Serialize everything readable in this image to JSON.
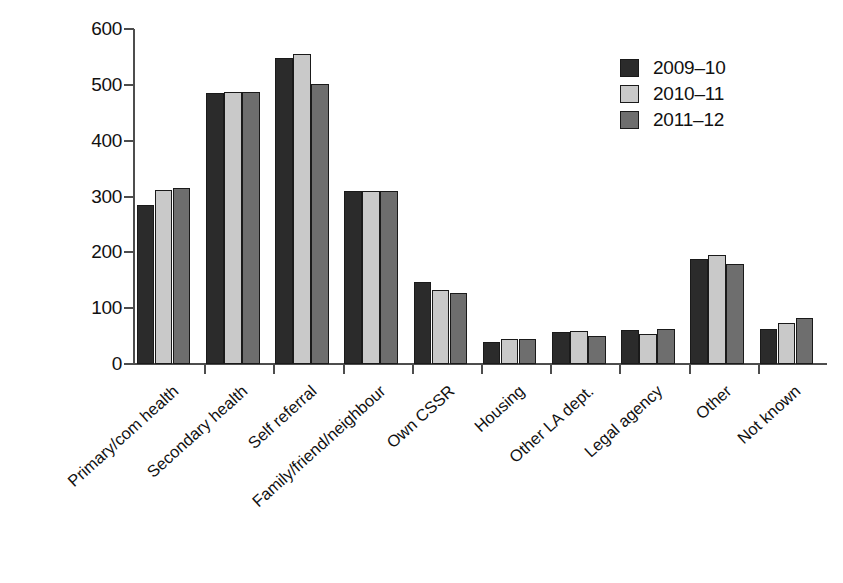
{
  "chart_data": {
    "type": "bar",
    "title": "",
    "subtitle": "",
    "xlabel": "",
    "ylabel": "",
    "ylim": [
      0,
      600
    ],
    "ytick_labels": [
      "600",
      "500",
      "400",
      "300",
      "200",
      "100",
      "0"
    ],
    "yticks": [
      600,
      500,
      400,
      300,
      200,
      100,
      0
    ],
    "grid": false,
    "legend_position": "top-right",
    "categories": [
      "Primary/com health",
      "Secondary health",
      "Self referral",
      "Family/friend/neighbour",
      "Own CSSR",
      "Housing",
      "Other LA dept.",
      "Legal agency",
      "Other",
      "Not known"
    ],
    "series": [
      {
        "name": "2009–10",
        "color": "#2b2b2b",
        "values": [
          284,
          486,
          548,
          310,
          147,
          40,
          57,
          61,
          188,
          63
        ]
      },
      {
        "name": "2010–11",
        "color": "#c9c9c9",
        "values": [
          312,
          487,
          555,
          310,
          133,
          45,
          59,
          54,
          195,
          74
        ]
      },
      {
        "name": "2011–12",
        "color": "#6e6e6e",
        "values": [
          315,
          487,
          501,
          310,
          127,
          45,
          50,
          63,
          180,
          83
        ]
      }
    ]
  },
  "legend": {
    "items": [
      {
        "label": "2009–10",
        "color": "#2b2b2b"
      },
      {
        "label": "2010–11",
        "color": "#c9c9c9"
      },
      {
        "label": "2011–12",
        "color": "#6e6e6e"
      }
    ]
  },
  "axes": {
    "y": {
      "ticks": [
        "600",
        "500",
        "400",
        "300",
        "200",
        "100",
        "0"
      ]
    }
  }
}
